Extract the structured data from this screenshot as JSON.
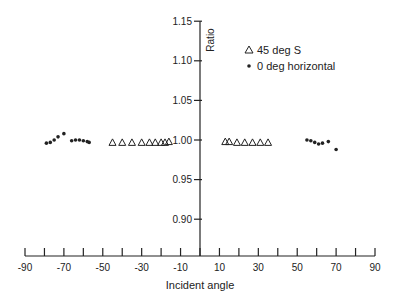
{
  "chart_data": {
    "type": "scatter",
    "title": "",
    "xlabel": "Incident angle",
    "ylabel": "Ratio",
    "xlim": [
      -90,
      90
    ],
    "ylim": [
      0.87,
      1.15
    ],
    "x_ticks": [
      -90,
      -80,
      -70,
      -60,
      -50,
      -40,
      -30,
      -20,
      -10,
      0,
      10,
      20,
      30,
      40,
      50,
      60,
      70,
      80,
      90
    ],
    "x_tick_labels": [
      "-90",
      "-70",
      "-50",
      "-30",
      "-10",
      "10",
      "30",
      "50",
      "70",
      "90"
    ],
    "y_ticks": [
      1.15,
      1.1,
      1.05,
      1.0,
      0.95,
      0.9
    ],
    "y_tick_labels": [
      "1.15",
      "1.10",
      "1.05",
      "1.00",
      "0.95",
      "0.90"
    ],
    "grid": false,
    "legend_position": "upper right of y-axis",
    "series": [
      {
        "name": "45 deg S",
        "marker": "triangle-open",
        "x": [
          -45,
          -40,
          -35,
          -30,
          -26,
          -23,
          -20,
          -18,
          -16,
          13,
          15,
          19,
          23,
          27,
          31,
          35
        ],
        "y": [
          0.997,
          0.997,
          0.997,
          0.997,
          0.997,
          0.997,
          0.997,
          0.997,
          0.998,
          0.998,
          0.998,
          0.997,
          0.997,
          0.997,
          0.997,
          0.997
        ]
      },
      {
        "name": "0 deg horizontal",
        "marker": "dot",
        "x": [
          -79,
          -77,
          -75,
          -73,
          -70,
          -66,
          -64,
          -62,
          -60,
          -58,
          -57,
          55,
          57,
          59,
          61,
          63,
          66,
          70
        ],
        "y": [
          0.996,
          0.997,
          1.0,
          1.004,
          1.008,
          0.999,
          1.0,
          1.0,
          0.999,
          0.998,
          0.997,
          1.0,
          0.999,
          0.997,
          0.995,
          0.996,
          0.998,
          0.988
        ]
      }
    ]
  },
  "legend": {
    "items": [
      {
        "label": "45 deg S",
        "marker": "triangle"
      },
      {
        "label": "0 deg horizontal",
        "marker": "dot"
      }
    ]
  }
}
